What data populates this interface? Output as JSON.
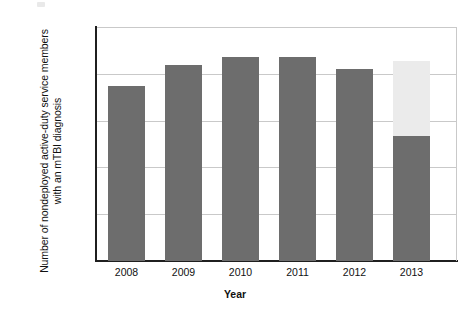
{
  "chart_data": {
    "type": "bar",
    "title": "",
    "subtitle": "",
    "xlabel": "Year",
    "ylabel": "Number of nondeployed active-duty service members with an mTBI diagnosis",
    "categories": [
      "2008",
      "2009",
      "2010",
      "2011",
      "2012",
      "2013"
    ],
    "ylim": [
      0,
      25000
    ],
    "ytick_labels": [
      "0",
      "5,000",
      "10,000",
      "15,000",
      "20,000",
      "25,000"
    ],
    "ytick_values": [
      0,
      5000,
      10000,
      15000,
      20000,
      25000
    ],
    "grid": "horizontal",
    "legend": "none",
    "series": [
      {
        "name": "Reported diagnoses",
        "color": "#6d6d6d",
        "values": [
          18650,
          20900,
          21750,
          21800,
          20550,
          13400
        ]
      },
      {
        "name": "Partial-year / incomplete data",
        "color": "#ebebeb",
        "values": [
          0,
          0,
          0,
          0,
          0,
          8000
        ]
      }
    ],
    "totals": [
      18650,
      20900,
      21750,
      21800,
      20550,
      21400
    ],
    "annotations": [
      "2013 bar is stacked: dark lower segment to ~13,400 and light upper segment to ~21,400"
    ]
  },
  "axis": {
    "y_title": "Number of nondeployed active-duty service members with an mTBI diagnosis",
    "x_title": "Year"
  }
}
